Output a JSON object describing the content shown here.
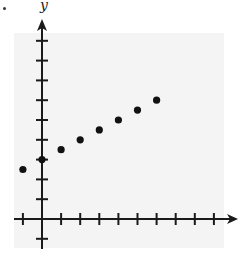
{
  "chart_data": {
    "type": "scatter",
    "title": "",
    "xlabel": "",
    "ylabel": "y",
    "xlim": [
      -1,
      9
    ],
    "ylim": [
      -1,
      9
    ],
    "grid": false,
    "legend": null,
    "x_ticks": [
      -1,
      0,
      1,
      2,
      3,
      4,
      5,
      6,
      7,
      8,
      9
    ],
    "y_ticks": [
      -1,
      0,
      1,
      2,
      3,
      4,
      5,
      6,
      7,
      8,
      9
    ],
    "tick_labels_shown": false,
    "series": [
      {
        "name": "points",
        "x": [
          -1,
          0,
          1,
          2,
          3,
          4,
          5,
          6
        ],
        "y": [
          2.5,
          3,
          3.5,
          4,
          4.5,
          5,
          5.5,
          6
        ]
      }
    ]
  },
  "colors": {
    "panel": "#f4f4f4",
    "axis": "#1a1a1a",
    "point": "#111111"
  }
}
